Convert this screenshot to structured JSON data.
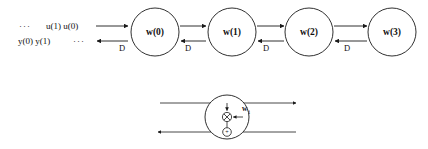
{
  "figure": {
    "background_color": "#ffffff",
    "line_color": "#1a1a1a",
    "width": 428,
    "height": 149
  },
  "top_diagram": {
    "input_stream": {
      "leading_dots": "···",
      "samples": "u(1) u(0)"
    },
    "output_stream": {
      "samples": "y(0) y(1)",
      "trailing_dots": "···"
    },
    "nodes": [
      {
        "label": "w(0)",
        "cx": 155,
        "cy": 32,
        "r": 24
      },
      {
        "label": "w(1)",
        "cx": 232,
        "cy": 32,
        "r": 24
      },
      {
        "label": "w(2)",
        "cx": 309,
        "cy": 32,
        "r": 24
      },
      {
        "label": "w(3)",
        "cx": 392,
        "cy": 32,
        "r": 24
      }
    ],
    "delay_labels": [
      {
        "text": "D",
        "x": 122,
        "y": 49
      },
      {
        "text": "D",
        "x": 188,
        "y": 49
      },
      {
        "text": "D",
        "x": 266,
        "y": 49
      },
      {
        "text": "D",
        "x": 347,
        "y": 49
      }
    ]
  },
  "detail_diagram": {
    "node": {
      "cx": 227,
      "cy": 117,
      "r": 22
    },
    "multiplier_symbol": "⊗",
    "adder_symbol": "+",
    "weight_label": {
      "base": "w",
      "subscript": "i"
    },
    "top_line": {
      "direction": "right",
      "x1": 160,
      "x2": 296,
      "y": 103
    },
    "bottom_line": {
      "direction": "left",
      "x1": 296,
      "x2": 158,
      "y": 132
    }
  }
}
